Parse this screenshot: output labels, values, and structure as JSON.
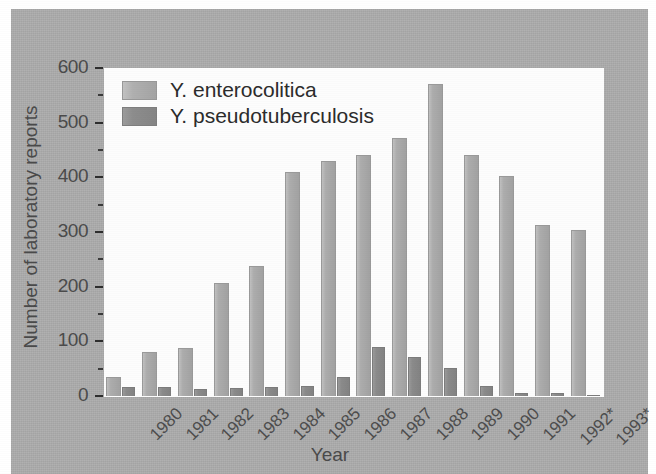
{
  "chart_data": {
    "type": "bar",
    "title": "",
    "subtitle": "",
    "xlabel": "Year",
    "ylabel": "Number of laboratory reports",
    "categories": [
      "1980",
      "1981",
      "1982",
      "1983",
      "1984",
      "1985",
      "1986",
      "1987",
      "1988",
      "1989",
      "1990",
      "1991",
      "1992*",
      "1993*"
    ],
    "series": [
      {
        "name": "Y. enterocolitica",
        "color": "#adadad",
        "values": [
          35,
          80,
          88,
          207,
          238,
          410,
          430,
          440,
          472,
          570,
          440,
          403,
          313,
          303
        ]
      },
      {
        "name": "Y. pseudotuberculosis",
        "color": "#8b8b8b",
        "values": [
          16,
          16,
          13,
          15,
          16,
          19,
          35,
          90,
          72,
          52,
          18,
          5,
          6,
          2
        ]
      }
    ],
    "ylim": [
      0,
      600
    ],
    "ytick_labels": [
      "0",
      "100",
      "200",
      "300",
      "400",
      "500",
      "600"
    ],
    "ytick_values": [
      0,
      100,
      200,
      300,
      400,
      500,
      600
    ],
    "yminor_values": [
      50,
      150,
      250,
      350,
      450,
      550
    ],
    "grid": false,
    "legend_position": "top-left",
    "legend_entries": [
      "Y. enterocolitica",
      "Y. pseudotuberculosis"
    ],
    "annotations": [],
    "xtick_rotation": -45,
    "plot_background": "#fdfdfd",
    "figure_background": "#adadad"
  }
}
